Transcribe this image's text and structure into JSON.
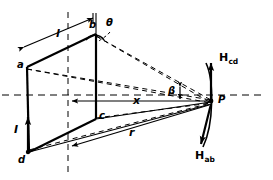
{
  "figure": {
    "type": "physics-diagram",
    "stroke_color": "#000000",
    "background_color": "#ffffff",
    "canvas": {
      "width": 273,
      "height": 180
    }
  },
  "vertices": [
    {
      "id": "a",
      "label": "a",
      "x": 27,
      "y": 67
    },
    {
      "id": "b",
      "label": "b",
      "x": 96,
      "y": 34
    },
    {
      "id": "c",
      "label": "c",
      "x": 96,
      "y": 119
    },
    {
      "id": "d",
      "label": "d",
      "x": 27,
      "y": 152
    }
  ],
  "point_labels": {
    "a": "a",
    "b": "b",
    "c": "c",
    "d": "d",
    "p": "P"
  },
  "dimensions": {
    "length": "l",
    "distance_x": "x",
    "distance_r": "r"
  },
  "angles": {
    "theta": "θ",
    "beta": "β"
  },
  "current": {
    "label": "I",
    "direction": "up"
  },
  "field_vectors": [
    {
      "name": "H_cd",
      "base": "H",
      "sub": "cd",
      "direction": "up"
    },
    {
      "name": "H_ab",
      "base": "H",
      "sub": "ab",
      "direction": "down-left"
    }
  ],
  "observation_point": {
    "label": "P",
    "x": 213,
    "y": 101
  }
}
